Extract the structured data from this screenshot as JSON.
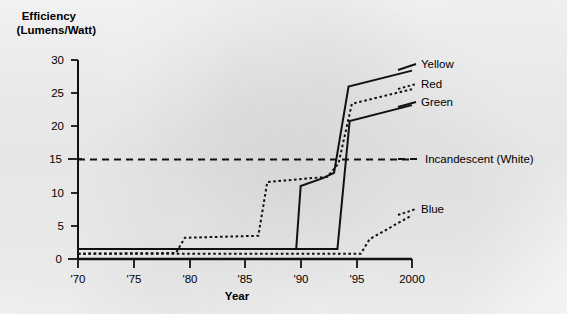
{
  "chart_data": {
    "type": "line",
    "title": "",
    "xlabel": "Year",
    "ylabel": "Efficiency (Lumens/Watt)",
    "ylabel_line1": "Efficiency",
    "ylabel_line2": "(Lumens/Watt)",
    "xlim": [
      1970,
      2000
    ],
    "ylim": [
      0,
      30
    ],
    "grid": false,
    "legend_position": "right-inline",
    "xticks": [
      1970,
      1975,
      1980,
      1985,
      1990,
      1995,
      2000
    ],
    "xtick_labels": [
      "'70",
      "'75",
      "'80",
      "'85",
      "'90",
      "'95",
      "2000"
    ],
    "yticks": [
      0,
      5,
      10,
      15,
      20,
      25,
      30
    ],
    "ytick_labels": [
      "0",
      "5",
      "10",
      "15",
      "20",
      "25",
      "30"
    ],
    "series": [
      {
        "name": "Yellow",
        "label": "Yellow",
        "style": "solid",
        "color": "#111111",
        "points": [
          [
            1970,
            1.5
          ],
          [
            1989.6,
            1.5
          ],
          [
            1990.0,
            11.0
          ],
          [
            1992.0,
            12.2
          ],
          [
            1993.0,
            13.0
          ],
          [
            1994.3,
            26.0
          ],
          [
            2000,
            28.4
          ]
        ]
      },
      {
        "name": "Red",
        "label": "Red",
        "style": "dotted",
        "color": "#111111",
        "points": [
          [
            1970,
            0.8
          ],
          [
            1978.8,
            0.9
          ],
          [
            1979.6,
            3.2
          ],
          [
            1986.2,
            3.5
          ],
          [
            1987.0,
            11.6
          ],
          [
            1992.4,
            12.4
          ],
          [
            1993.4,
            14.4
          ],
          [
            1994.6,
            23.4
          ],
          [
            2000,
            25.6
          ]
        ]
      },
      {
        "name": "Green",
        "label": "Green",
        "style": "solid",
        "color": "#111111",
        "points": [
          [
            1970,
            1.5
          ],
          [
            1993.0,
            1.5
          ],
          [
            1993.3,
            1.5
          ],
          [
            1994.4,
            20.8
          ],
          [
            2000,
            23.2
          ]
        ]
      },
      {
        "name": "Blue",
        "label": "Blue",
        "style": "dotted",
        "color": "#111111",
        "points": [
          [
            1970,
            0.8
          ],
          [
            1995.4,
            0.8
          ],
          [
            1996.2,
            3.0
          ],
          [
            2000,
            6.6
          ]
        ]
      },
      {
        "name": "Incandescent (White)",
        "label": "Incandescent (White)",
        "style": "dashed",
        "color": "#111111",
        "points": [
          [
            1970,
            15.0
          ],
          [
            2000,
            15.0
          ]
        ]
      }
    ],
    "annotations": [
      {
        "text": "Yellow",
        "x": 2000,
        "y": 28.4
      },
      {
        "text": "Red",
        "x": 2000,
        "y": 25.6
      },
      {
        "text": "Green",
        "x": 2000,
        "y": 23.2
      },
      {
        "text": "Incandescent (White)",
        "x": 2000,
        "y": 15.0
      },
      {
        "text": "Blue",
        "x": 2000,
        "y": 6.6
      }
    ]
  },
  "axes": {
    "y_label_line1": "Efficiency",
    "y_label_line2": "(Lumens/Watt)",
    "x_label": "Year"
  },
  "ticks": {
    "y": [
      "30",
      "25",
      "20",
      "15",
      "10",
      "5",
      "0"
    ],
    "x": [
      "'70",
      "'75",
      "'80",
      "'85",
      "'90",
      "'95",
      "2000"
    ]
  },
  "legend": {
    "yellow": "Yellow",
    "red": "Red",
    "green": "Green",
    "incandescent": "Incandescent (White)",
    "blue": "Blue"
  }
}
